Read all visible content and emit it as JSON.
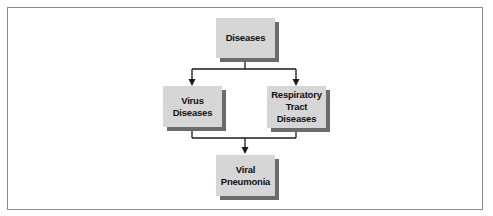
{
  "diagram": {
    "type": "flowchart",
    "colors": {
      "node_fill": "#d6d6d6",
      "node_shadow": "#6b6b6b",
      "line": "#1a1a1a",
      "frame_border": "#8a8a8a"
    },
    "nodes": [
      {
        "id": "diseases",
        "label": "Diseases"
      },
      {
        "id": "virus-diseases",
        "label": "Virus\nDiseases"
      },
      {
        "id": "respiratory-tract-diseases",
        "label": "Respiratory\nTract\nDiseases"
      },
      {
        "id": "viral-pneumonia",
        "label": "Viral\nPneumonia"
      }
    ],
    "edges": [
      {
        "from": "diseases",
        "to": "virus-diseases"
      },
      {
        "from": "diseases",
        "to": "respiratory-tract-diseases"
      },
      {
        "from": "virus-diseases",
        "to": "viral-pneumonia"
      },
      {
        "from": "respiratory-tract-diseases",
        "to": "viral-pneumonia"
      }
    ]
  }
}
